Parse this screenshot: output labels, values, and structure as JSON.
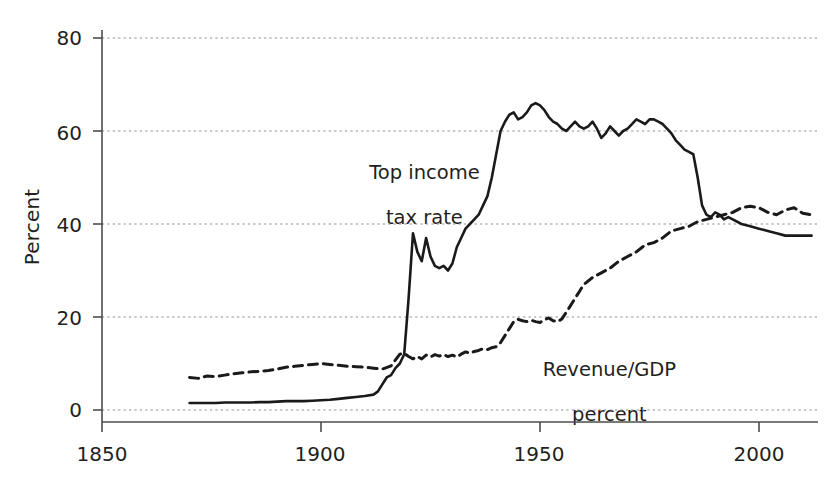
{
  "chart_data": {
    "type": "line",
    "title": "",
    "subtitle": "",
    "xlabel": "",
    "ylabel": "Percent",
    "xlim": [
      1838,
      2015
    ],
    "ylim": [
      -3,
      84
    ],
    "grid": true,
    "grid_axis": "y",
    "legend_position": "inline-annotation",
    "xticks": [
      1850,
      1900,
      1950,
      2000
    ],
    "xtick_labels": [
      "1850",
      "1900",
      "1950",
      "2000"
    ],
    "yticks": [
      0,
      20,
      40,
      60,
      80
    ],
    "ytick_labels": [
      "0",
      "20",
      "40",
      "60",
      "80"
    ],
    "annotations": [
      {
        "text": "Top income\ntax rate",
        "x": 1928,
        "y": 50
      },
      {
        "text": "Revenue/GDP\npercent",
        "x": 1963,
        "y": 15
      }
    ],
    "series": [
      {
        "name": "Top income tax rate",
        "label": "Top income\ntax rate",
        "style": "solid",
        "color": "#1a1a1a",
        "width": 2.6,
        "x": [
          1870,
          1872,
          1874,
          1876,
          1878,
          1880,
          1882,
          1884,
          1886,
          1888,
          1890,
          1892,
          1894,
          1896,
          1898,
          1900,
          1902,
          1904,
          1906,
          1908,
          1910,
          1912,
          1913,
          1914,
          1915,
          1916,
          1917,
          1918,
          1919,
          1920,
          1921,
          1922,
          1923,
          1924,
          1925,
          1926,
          1927,
          1928,
          1929,
          1930,
          1931,
          1932,
          1933,
          1934,
          1935,
          1936,
          1937,
          1938,
          1939,
          1940,
          1941,
          1942,
          1943,
          1944,
          1945,
          1946,
          1947,
          1948,
          1949,
          1950,
          1951,
          1952,
          1953,
          1954,
          1955,
          1956,
          1957,
          1958,
          1959,
          1960,
          1961,
          1962,
          1963,
          1964,
          1965,
          1966,
          1967,
          1968,
          1969,
          1970,
          1971,
          1972,
          1973,
          1974,
          1975,
          1976,
          1977,
          1978,
          1979,
          1980,
          1981,
          1982,
          1983,
          1984,
          1985,
          1986,
          1987,
          1988,
          1989,
          1990,
          1991,
          1992,
          1993,
          1994,
          1996,
          1998,
          2000,
          2002,
          2004,
          2006,
          2008,
          2010,
          2012
        ],
        "y": [
          1.5,
          1.5,
          1.5,
          1.5,
          1.6,
          1.6,
          1.6,
          1.6,
          1.7,
          1.7,
          1.8,
          1.9,
          1.9,
          1.9,
          2.0,
          2.1,
          2.2,
          2.4,
          2.6,
          2.8,
          3.0,
          3.3,
          4.0,
          5.5,
          7.0,
          7.5,
          9.0,
          10.0,
          12.0,
          24.0,
          38.0,
          34.0,
          32.0,
          37.0,
          33.0,
          31.0,
          30.5,
          31.0,
          30.0,
          31.5,
          35.0,
          37.0,
          39.0,
          40.0,
          41.0,
          42.0,
          44.0,
          46.0,
          50.0,
          55.0,
          60.0,
          62.0,
          63.5,
          64.0,
          62.5,
          63.0,
          64.0,
          65.5,
          66.0,
          65.5,
          64.5,
          63.0,
          62.0,
          61.5,
          60.5,
          60.0,
          61.0,
          62.0,
          61.0,
          60.5,
          61.0,
          62.0,
          60.5,
          58.5,
          59.5,
          61.0,
          60.0,
          59.0,
          60.0,
          60.5,
          61.5,
          62.5,
          62.0,
          61.5,
          62.5,
          62.5,
          62.0,
          61.5,
          60.5,
          59.5,
          58.0,
          57.0,
          56.0,
          55.5,
          55.0,
          50.0,
          44.0,
          42.0,
          41.5,
          42.5,
          42.0,
          41.0,
          41.5,
          41.0,
          40.0,
          39.5,
          39.0,
          38.5,
          38.0,
          37.5,
          37.5,
          37.5,
          37.5
        ]
      },
      {
        "name": "Revenue/GDP percent",
        "label": "Revenue/GDP\npercent",
        "style": "dashed",
        "color": "#1a1a1a",
        "width": 3.0,
        "dash": "9,6",
        "x": [
          1870,
          1872,
          1874,
          1876,
          1878,
          1880,
          1882,
          1884,
          1886,
          1888,
          1890,
          1892,
          1894,
          1896,
          1898,
          1900,
          1902,
          1904,
          1906,
          1908,
          1910,
          1912,
          1914,
          1916,
          1918,
          1919,
          1920,
          1921,
          1922,
          1923,
          1924,
          1925,
          1926,
          1927,
          1928,
          1929,
          1930,
          1931,
          1932,
          1933,
          1934,
          1935,
          1936,
          1937,
          1938,
          1939,
          1940,
          1941,
          1942,
          1943,
          1944,
          1945,
          1946,
          1947,
          1948,
          1949,
          1950,
          1951,
          1952,
          1953,
          1954,
          1955,
          1956,
          1957,
          1958,
          1959,
          1960,
          1962,
          1964,
          1966,
          1968,
          1970,
          1972,
          1974,
          1976,
          1978,
          1980,
          1982,
          1984,
          1986,
          1988,
          1990,
          1992,
          1994,
          1996,
          1998,
          2000,
          2002,
          2004,
          2006,
          2008,
          2010,
          2012
        ],
        "y": [
          7.0,
          6.8,
          7.3,
          7.2,
          7.5,
          7.8,
          8.0,
          8.2,
          8.3,
          8.5,
          8.8,
          9.2,
          9.4,
          9.6,
          9.8,
          10.0,
          9.8,
          9.6,
          9.4,
          9.3,
          9.2,
          9.0,
          8.8,
          9.5,
          12.0,
          12.2,
          11.5,
          11.0,
          11.5,
          11.0,
          11.8,
          11.4,
          11.9,
          11.6,
          11.9,
          11.5,
          11.8,
          11.4,
          12.0,
          12.5,
          12.2,
          12.6,
          12.8,
          13.2,
          13.0,
          13.4,
          13.6,
          14.5,
          16.0,
          17.5,
          19.0,
          19.5,
          19.2,
          19.0,
          19.3,
          19.0,
          18.8,
          19.4,
          19.8,
          19.2,
          19.0,
          19.6,
          21.0,
          22.5,
          24.0,
          25.5,
          27.0,
          28.5,
          29.5,
          30.5,
          32.0,
          33.0,
          34.0,
          35.5,
          36.0,
          37.0,
          38.5,
          39.0,
          39.5,
          40.5,
          41.0,
          41.5,
          42.0,
          42.5,
          43.5,
          43.8,
          43.5,
          42.5,
          42.0,
          43.0,
          43.5,
          42.3,
          42.0
        ]
      }
    ]
  },
  "axis": {
    "y_title": "Percent",
    "x_tick_labels": [
      "1850",
      "1900",
      "1950",
      "2000"
    ],
    "y_tick_labels": [
      "80",
      "60",
      "40",
      "20",
      "0"
    ]
  },
  "annotations": {
    "tax_line1": "Top income",
    "tax_line2": "tax rate",
    "revenue_line1": "Revenue/GDP",
    "revenue_line2": "percent"
  },
  "colors": {
    "ink": "#231f20",
    "line": "#1a1a1a",
    "grid": "#8d8d8d",
    "axis": "#4d4d4d",
    "background": "#ffffff"
  }
}
